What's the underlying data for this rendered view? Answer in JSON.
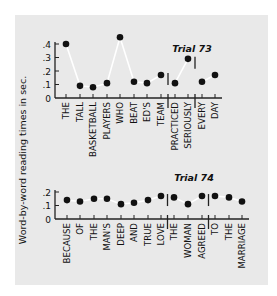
{
  "chart_data": [
    {
      "type": "line",
      "title": "Trial 73",
      "xlabel": "",
      "ylabel": "Word-by-word reading times in sec.",
      "ylim": [
        0,
        0.4
      ],
      "yticks": [
        "0",
        ".1",
        ".2",
        ".3",
        ".4"
      ],
      "grid": false,
      "categories": [
        "THE",
        "TALL",
        "BASKETBALL",
        "PLAYERS",
        "WHO",
        "BEAT",
        "ED'S",
        "TEAM",
        "PRACTICED",
        "SERIOUSLY",
        "EVERY",
        "DAY"
      ],
      "values": [
        0.4,
        0.09,
        0.08,
        0.11,
        0.45,
        0.12,
        0.11,
        0.17,
        0.11,
        0.29,
        0.12,
        0.17
      ],
      "phrase_boundaries_after": [
        "TEAM",
        "SERIOUSLY"
      ]
    },
    {
      "type": "line",
      "title": "Trial 74",
      "xlabel": "",
      "ylabel": "Word-by-word reading times in sec.",
      "ylim": [
        0,
        0.2
      ],
      "yticks": [
        "0",
        ".1",
        ".2"
      ],
      "grid": false,
      "categories": [
        "BECAUSE",
        "OF",
        "THE",
        "MAN'S",
        "DEEP",
        "AND",
        "TRUE",
        "LOVE",
        "THE",
        "WOMAN",
        "AGREED",
        "TO",
        "THE",
        "MARRIAGE"
      ],
      "values": [
        0.14,
        0.13,
        0.15,
        0.15,
        0.11,
        0.12,
        0.14,
        0.17,
        0.16,
        0.11,
        0.17,
        0.17,
        0.16,
        0.13
      ],
      "phrase_boundaries_after": [
        "LOVE",
        "AGREED"
      ]
    }
  ],
  "labels": {
    "ylabel": "Word-by-word reading times in sec.",
    "trial_top": "Trial 73",
    "trial_bottom": "Trial 74"
  },
  "colors": {
    "panel_bg": "#e9e9e9",
    "line": "#ffffff",
    "marker": "#111111",
    "axis": "#222222"
  }
}
